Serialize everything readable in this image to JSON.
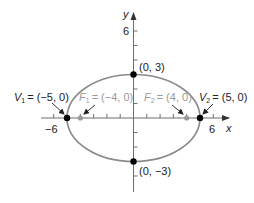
{
  "diagram": {
    "type": "ellipse-graph",
    "equation_semantics": "horizontal ellipse centered at origin, a=5, b=3, c=4",
    "axes": {
      "x_label": "x",
      "y_label": "y",
      "x_tick_labels": [
        "−6",
        "6"
      ],
      "y_tick_labels": [
        "6"
      ]
    },
    "points": {
      "v1": {
        "label": "V₁ = (−5, 0)",
        "name_main": "V",
        "name_sub": "1",
        "coords": "= (−5, 0)",
        "x": -5,
        "y": 0
      },
      "v2": {
        "label": "V₂ = (5, 0)",
        "name_main": "V",
        "name_sub": "2",
        "coords": "= (5, 0)",
        "x": 5,
        "y": 0
      },
      "f1": {
        "label": "F₁ = (−4, 0)",
        "name_main": "F",
        "name_sub": "1",
        "coords": "= (−4, 0)",
        "x": -4,
        "y": 0
      },
      "f2": {
        "label": "F₂ = (4, 0)",
        "name_main": "F",
        "name_sub": "2",
        "coords": "= (4, 0)",
        "x": 4,
        "y": 0
      },
      "top": {
        "label": "(0, 3)",
        "x": 0,
        "y": 3
      },
      "bottom": {
        "label": "(0, −3)",
        "x": 0,
        "y": -3
      }
    },
    "colors": {
      "ellipse": "#8a8a8a",
      "axis": "#6e6e6e",
      "vertex": "#000000",
      "focus": "#9a9a9a",
      "focus_label": "#9a9a9a",
      "label": "#222222"
    }
  }
}
